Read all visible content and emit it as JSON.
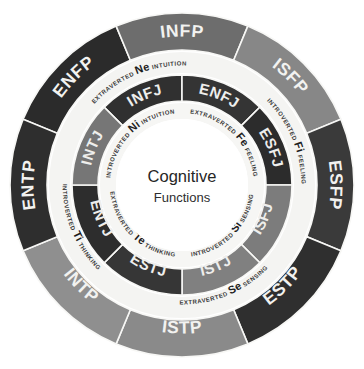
{
  "diagram": {
    "center": {
      "line1": "Cognitive",
      "line2": "Functions"
    },
    "background_color": "#ffffff",
    "shape": "concentric-rings",
    "ring_count": 3
  },
  "chart_data": {
    "type": "pie",
    "legend_position": "none",
    "grid": false,
    "rings": [
      {
        "name": "outer-ring",
        "role": "mbti-types-perceiving-dominant",
        "slice_count": 8,
        "slice_degrees": 45,
        "slices": [
          {
            "label": "ENFP",
            "start_deg": 292.5,
            "color": "#2b2b2b",
            "text_color": "#f2f2f0"
          },
          {
            "label": "INFP",
            "start_deg": 337.5,
            "color": "#6d6d6d",
            "text_color": "#f2f2f0"
          },
          {
            "label": "ISFP",
            "start_deg": 22.5,
            "color": "#878787",
            "text_color": "#f2f2f0"
          },
          {
            "label": "ESFP",
            "start_deg": 67.5,
            "color": "#3a3a3a",
            "text_color": "#f2f2f0"
          },
          {
            "label": "ESTP",
            "start_deg": 112.5,
            "color": "#2f2f2f",
            "text_color": "#f2f2f0"
          },
          {
            "label": "ISTP",
            "start_deg": 157.5,
            "color": "#8a8a8a",
            "text_color": "#f2f2f0"
          },
          {
            "label": "INTP",
            "start_deg": 202.5,
            "color": "#8f8f8f",
            "text_color": "#f2f2f0"
          },
          {
            "label": "ENTP",
            "start_deg": 247.5,
            "color": "#2e2e2e",
            "text_color": "#f2f2f0"
          }
        ]
      },
      {
        "name": "middle-ring",
        "role": "auxiliary-function-band",
        "slice_count": 4,
        "slice_degrees": 90,
        "slices": [
          {
            "code": "Ne",
            "attitude": "EXTRAVERTED",
            "function": "INTUITION",
            "full_label": "EXTRAVERTED Ne INTUITION",
            "start_deg": 292.5,
            "color": "#f4f4f2",
            "text_color": "#1d1d1d"
          },
          {
            "code": "Fi",
            "attitude": "INTROVERTED",
            "function": "FEELING",
            "full_label": "INTROVERTED Fi FEELING",
            "start_deg": 22.5,
            "color": "#f4f4f2",
            "text_color": "#1d1d1d"
          },
          {
            "code": "Se",
            "attitude": "EXTRAVERTED",
            "function": "SENSING",
            "full_label": "EXTRAVERTED Se SENSING",
            "start_deg": 112.5,
            "color": "#f4f4f2",
            "text_color": "#1d1d1d"
          },
          {
            "code": "Ti",
            "attitude": "INTROVERTED",
            "function": "THINKING",
            "full_label": "INTROVERTED Ti THINKING",
            "start_deg": 202.5,
            "color": "#f4f4f2",
            "text_color": "#1d1d1d"
          }
        ]
      },
      {
        "name": "inner-ring",
        "role": "mbti-types-judging-dominant",
        "slice_count": 8,
        "slice_degrees": 45,
        "slices": [
          {
            "label": "INFJ",
            "start_deg": 315,
            "color": "#303030",
            "text_color": "#eeeeec"
          },
          {
            "label": "ENFJ",
            "start_deg": 360,
            "color": "#343434",
            "text_color": "#eeeeec"
          },
          {
            "label": "ESFJ",
            "start_deg": 45,
            "color": "#2c2c2c",
            "text_color": "#eeeeec"
          },
          {
            "label": "ISFJ",
            "start_deg": 90,
            "color": "#7c7c7c",
            "text_color": "#eeeeec"
          },
          {
            "label": "ISTJ",
            "start_deg": 135,
            "color": "#808080",
            "text_color": "#eeeeec"
          },
          {
            "label": "ESTJ",
            "start_deg": 180,
            "color": "#363636",
            "text_color": "#eeeeec"
          },
          {
            "label": "ENTJ",
            "start_deg": 225,
            "color": "#2d2d2d",
            "text_color": "#eeeeec"
          },
          {
            "label": "INTJ",
            "start_deg": 270,
            "color": "#767676",
            "text_color": "#eeeeec"
          }
        ]
      },
      {
        "name": "inner-function-band",
        "role": "dominant-function-band",
        "slice_count": 4,
        "slice_degrees": 90,
        "slices": [
          {
            "code": "Ni",
            "attitude": "INTROVERTED",
            "function": "INTUITION",
            "full_label": "INTROVERTED Ni INTUITION",
            "start_deg": 270,
            "color": "#f6f6f4",
            "text_color": "#1d1d1d"
          },
          {
            "code": "Fe",
            "attitude": "EXTRAVERTED",
            "function": "FEELING",
            "full_label": "EXTRAVERTED Fe FEELING",
            "start_deg": 0,
            "color": "#f6f6f4",
            "text_color": "#1d1d1d"
          },
          {
            "code": "Si",
            "attitude": "INTROVERTED",
            "function": "SENSING",
            "full_label": "INTROVERTED Si SENSING",
            "start_deg": 90,
            "color": "#f6f6f4",
            "text_color": "#1d1d1d"
          },
          {
            "code": "Te",
            "attitude": "EXTRAVERTED",
            "function": "THINKING",
            "full_label": "EXTRAVERTED Te THINKING",
            "start_deg": 180,
            "color": "#f6f6f4",
            "text_color": "#1d1d1d"
          }
        ]
      }
    ],
    "function_codes": [
      "Ne",
      "Ni",
      "Fi",
      "Fe",
      "Si",
      "Se",
      "Ti",
      "Te"
    ],
    "mbti_types": [
      "ENFP",
      "INFP",
      "ISFP",
      "ESFP",
      "ESTP",
      "ISTP",
      "INTP",
      "ENTP",
      "INFJ",
      "ENFJ",
      "ESFJ",
      "ISFJ",
      "ISTJ",
      "ESTJ",
      "ENTJ",
      "INTJ"
    ]
  }
}
